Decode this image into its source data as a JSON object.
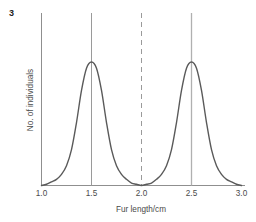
{
  "figure": {
    "number": "3",
    "caption": ""
  },
  "chart_data": {
    "type": "line",
    "title": "",
    "subtitle": "",
    "xlabel": "Fur length/cm",
    "ylabel": "No. of individuals",
    "xlim": [
      1.0,
      3.0
    ],
    "ylim": [
      0,
      1
    ],
    "xticks": [
      1.0,
      1.5,
      2.0,
      2.5,
      3.0
    ],
    "xtick_labels": [
      "1.0",
      "1.5",
      "2.0",
      "2.5",
      "3.0"
    ],
    "yticks": [],
    "ytick_labels": [],
    "grid": false,
    "legend": null,
    "series": [
      {
        "name": "Fur length distribution",
        "description": "Bimodal (disruptive selection) frequency distribution with two equal peaks",
        "color": "#5a5a5a",
        "x": [
          1.0,
          1.05,
          1.1,
          1.15,
          1.2,
          1.25,
          1.3,
          1.35,
          1.4,
          1.45,
          1.5,
          1.55,
          1.6,
          1.65,
          1.7,
          1.75,
          1.8,
          1.85,
          1.9,
          1.95,
          2.0,
          2.05,
          2.1,
          2.15,
          2.2,
          2.25,
          2.3,
          2.35,
          2.4,
          2.45,
          2.5,
          2.55,
          2.6,
          2.65,
          2.7,
          2.75,
          2.8,
          2.85,
          2.9,
          2.95,
          3.0
        ],
        "y": [
          0.0,
          0.01,
          0.03,
          0.05,
          0.09,
          0.16,
          0.29,
          0.51,
          0.77,
          0.95,
          1.0,
          0.95,
          0.77,
          0.51,
          0.29,
          0.16,
          0.09,
          0.05,
          0.02,
          0.01,
          0.0,
          0.01,
          0.02,
          0.05,
          0.09,
          0.16,
          0.29,
          0.51,
          0.77,
          0.95,
          1.0,
          0.95,
          0.77,
          0.51,
          0.29,
          0.16,
          0.09,
          0.05,
          0.03,
          0.01,
          0.0
        ]
      }
    ],
    "annotations": [
      {
        "name": "peak-line-left",
        "type": "vline",
        "x": 1.5,
        "style": "solid",
        "color": "#9a9a9a"
      },
      {
        "name": "midpoint-line",
        "type": "vline",
        "x": 2.0,
        "style": "dashed",
        "color": "#9a9a9a"
      },
      {
        "name": "peak-line-right",
        "type": "vline",
        "x": 2.5,
        "style": "solid",
        "color": "#9a9a9a"
      }
    ],
    "colors": {
      "curve": "#5a5a5a",
      "axis": "#8f8f8f",
      "guide_line": "#9a9a9a",
      "text": "#4a4a4a",
      "background": "#ffffff"
    }
  }
}
